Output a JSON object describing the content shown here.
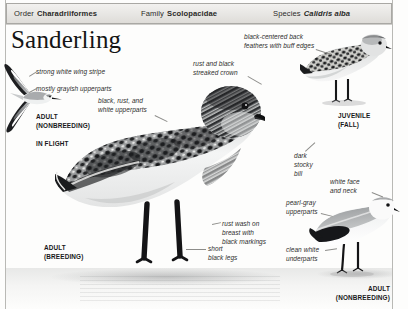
{
  "header": {
    "cells": [
      {
        "label": "Order",
        "name": "Charadriiformes",
        "italic": false
      },
      {
        "label": "Family",
        "name": "Scolopacidae",
        "italic": false
      },
      {
        "label": "Species",
        "name": "Calidris alba",
        "italic": true
      }
    ]
  },
  "title": "Sanderling",
  "annotations": {
    "wing_stripe": "strong white wing stripe",
    "grayish_upperparts": "mostly grayish upperparts",
    "black_rust_white": "black, rust, and\nwhite upperparts",
    "streaked_crown": "rust and black\nstreaked crown",
    "back_feathers": "black-centered back\nfeathers with buff edges",
    "stocky_bill": "dark\nstocky\nbill",
    "white_face": "white face\nand neck",
    "pearl_gray": "pearl-gray\nupperparts",
    "rust_wash": "rust wash on\nbreast with\nblack markings",
    "black_legs": "short\nblack legs",
    "clean_white": "clean white\nunderparts"
  },
  "plates": {
    "flight": "ADULT\n(NONBREEDING)",
    "flight_pose": "IN FLIGHT",
    "breeding": "ADULT\n(BREEDING)",
    "juvenile": "JUVENILE\n(FALL)",
    "nonbreeding": "ADULT\n(NONBREEDING)"
  },
  "icons": {
    "flying_bird": "flying-sanderling-icon",
    "breeding_bird": "breeding-sanderling-icon",
    "juvenile_bird": "juvenile-sanderling-icon",
    "nonbreeding_bird": "nonbreeding-sanderling-icon"
  },
  "colors": {
    "page": "#fdfdfc",
    "rule": "#b9b9b5",
    "header_fill": "#e7e6e3",
    "header_border": "#a9a8a4",
    "text": "#2a2a28",
    "leader": "#8d8d8a"
  }
}
